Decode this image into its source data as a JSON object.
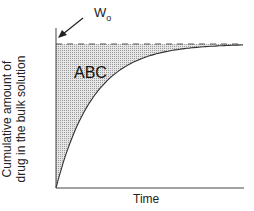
{
  "chart_data": {
    "type": "area",
    "title": "",
    "xlabel": "Time",
    "ylabel": "Cumulative amount of drug in the bulk solution",
    "ylabel_lines": [
      "Cumulative amount of",
      "drug in the bulk solution"
    ],
    "x_ticks": [],
    "y_ticks": [],
    "grid": false,
    "legend": null,
    "series": [
      {
        "name": "cumulative amount (1 - e^-kt)",
        "style": "solid curve",
        "x": [
          0,
          0.05,
          0.1,
          0.2,
          0.3,
          0.4,
          0.5,
          0.6,
          0.7,
          0.8,
          0.9,
          1.0
        ],
        "values": [
          0,
          0.22,
          0.39,
          0.63,
          0.78,
          0.86,
          0.92,
          0.95,
          0.97,
          0.98,
          0.99,
          1.0
        ]
      },
      {
        "name": "W0 asymptote",
        "style": "dashed horizontal line",
        "value": 1.0
      }
    ],
    "shaded_region": {
      "label": "ABC",
      "description": "area between W0 asymptote and curve",
      "pattern": "stipple"
    },
    "annotations": [
      {
        "text": "W",
        "subscript": "o",
        "arrow_to": "top of y-axis at W0 level"
      },
      {
        "text": "ABC",
        "position": "inside shaded region"
      }
    ]
  },
  "labels": {
    "ylabel_line1": "Cumulative amount of",
    "ylabel_line2": "drug in the bulk solution",
    "xlabel": "Time",
    "area": "ABC",
    "w0_main": "W",
    "w0_sub": "o"
  }
}
